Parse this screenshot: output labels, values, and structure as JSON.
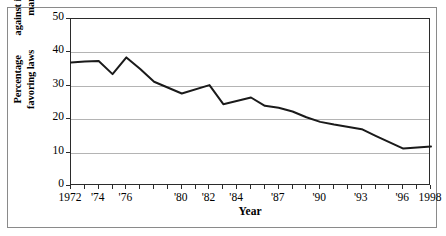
{
  "chart_data": {
    "type": "line",
    "title": "",
    "xlabel": "Year",
    "ylabel": "Percentage favoring laws against interracial marriage",
    "ylabel_line1": "Percentage favoring laws",
    "ylabel_line2": "against interracial marriage",
    "xlim": [
      1972,
      1998
    ],
    "ylim": [
      0,
      50
    ],
    "yticks": [
      0,
      10,
      20,
      30,
      40,
      50
    ],
    "ytick_labels": [
      "0",
      "10",
      "20",
      "30",
      "40",
      "50"
    ],
    "xticks": [
      1972,
      1973,
      1974,
      1975,
      1976,
      1977,
      1978,
      1979,
      1980,
      1981,
      1982,
      1983,
      1984,
      1985,
      1986,
      1987,
      1988,
      1989,
      1990,
      1991,
      1992,
      1993,
      1994,
      1995,
      1996,
      1997,
      1998
    ],
    "xtick_labels": [
      {
        "year": 1972,
        "label": "1972"
      },
      {
        "year": 1974,
        "label": "'74"
      },
      {
        "year": 1976,
        "label": "'76"
      },
      {
        "year": 1980,
        "label": "'80"
      },
      {
        "year": 1982,
        "label": "'82"
      },
      {
        "year": 1984,
        "label": "'84"
      },
      {
        "year": 1987,
        "label": "'87"
      },
      {
        "year": 1990,
        "label": "'90"
      },
      {
        "year": 1993,
        "label": "'93"
      },
      {
        "year": 1996,
        "label": "'96"
      },
      {
        "year": 1998,
        "label": "1998"
      }
    ],
    "grid": true,
    "grid_axis": "y",
    "legend": false,
    "line_color": "#1a1a1a",
    "grid_color": "#b4b4b4",
    "x": [
      1972,
      1973,
      1974,
      1975,
      1976,
      1977,
      1978,
      1980,
      1982,
      1983,
      1985,
      1986,
      1987,
      1988,
      1989,
      1990,
      1991,
      1993,
      1994,
      1996,
      1998
    ],
    "values": [
      37.0,
      37.3,
      37.4,
      33.5,
      38.5,
      35.0,
      31.2,
      27.7,
      30.2,
      24.5,
      26.5,
      24.0,
      23.4,
      22.3,
      20.6,
      19.2,
      18.4,
      17.0,
      15.0,
      11.2,
      11.8
    ],
    "series": [
      {
        "name": "Percentage favoring laws against interracial marriage",
        "points": [
          {
            "year": 1972,
            "value": 37.0
          },
          {
            "year": 1973,
            "value": 37.3
          },
          {
            "year": 1974,
            "value": 37.4
          },
          {
            "year": 1975,
            "value": 33.5
          },
          {
            "year": 1976,
            "value": 38.5
          },
          {
            "year": 1977,
            "value": 35.0
          },
          {
            "year": 1978,
            "value": 31.2
          },
          {
            "year": 1980,
            "value": 27.7
          },
          {
            "year": 1982,
            "value": 30.2
          },
          {
            "year": 1983,
            "value": 24.5
          },
          {
            "year": 1985,
            "value": 26.5
          },
          {
            "year": 1986,
            "value": 24.0
          },
          {
            "year": 1987,
            "value": 23.4
          },
          {
            "year": 1988,
            "value": 22.3
          },
          {
            "year": 1989,
            "value": 20.6
          },
          {
            "year": 1990,
            "value": 19.2
          },
          {
            "year": 1991,
            "value": 18.4
          },
          {
            "year": 1993,
            "value": 17.0
          },
          {
            "year": 1994,
            "value": 15.0
          },
          {
            "year": 1996,
            "value": 11.2
          },
          {
            "year": 1998,
            "value": 11.8
          }
        ]
      }
    ]
  }
}
